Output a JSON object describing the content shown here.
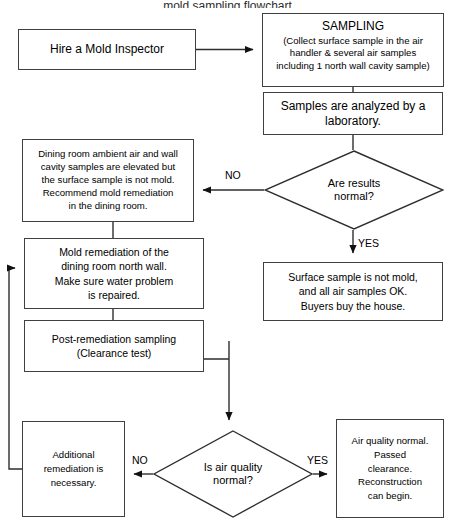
{
  "document": {
    "title_fragment": "mold sampling flowchart",
    "type": "process-flowchart",
    "background_color": "#ffffff",
    "line_color": "#404040",
    "text_color": "#000000"
  },
  "nodes": {
    "hire_inspector": {
      "id": "hire-inspector",
      "shape": "rectangle",
      "text": "Hire a Mold Inspector",
      "x": 18,
      "y": 29,
      "w": 178,
      "h": 41
    },
    "sampling": {
      "id": "sampling",
      "shape": "rectangle",
      "heading": "SAMPLING",
      "text": "(Collect surface sample in the air\nhandler & several air samples\nincluding 1 north wall cavity sample)",
      "x": 262,
      "y": 13,
      "w": 182,
      "h": 74
    },
    "lab_analysis": {
      "id": "lab-analysis",
      "shape": "rectangle",
      "text": "Samples are analyzed by a\nlaboratory.",
      "x": 263,
      "y": 92,
      "w": 180,
      "h": 43
    },
    "results_normal": {
      "id": "are-results-normal",
      "shape": "diamond",
      "text": "Are results\nnormal?",
      "x": 264,
      "y": 150,
      "w": 180,
      "h": 80
    },
    "dining_room_finding": {
      "id": "dining-room-finding",
      "shape": "rectangle",
      "text": "Dining room ambient air and wall\ncavity samples are elevated but\nthe surface sample is not mold.\nRecommend mold remediation\nin the dining room.",
      "x": 22,
      "y": 139,
      "w": 172,
      "h": 83
    },
    "surface_ok": {
      "id": "surface-sample-ok",
      "shape": "rectangle",
      "text": "Surface sample is not mold,\nand all air samples OK.\nBuyers buy the house.",
      "x": 263,
      "y": 262,
      "w": 180,
      "h": 59
    },
    "mold_remediation": {
      "id": "mold-remediation",
      "shape": "rectangle",
      "text": "Mold remediation of the\ndining room north wall.\nMake sure water problem\nis repaired.",
      "x": 24,
      "y": 238,
      "w": 180,
      "h": 71
    },
    "post_remediation": {
      "id": "post-remediation-sampling",
      "shape": "rectangle",
      "text": "Post-remediation sampling\n(Clearance test)",
      "x": 24,
      "y": 320,
      "w": 180,
      "h": 52
    },
    "air_quality_normal": {
      "id": "is-air-quality-normal",
      "shape": "diamond",
      "text": "Is air quality\nnormal?",
      "x": 153,
      "y": 430,
      "w": 160,
      "h": 88
    },
    "additional_remediation": {
      "id": "additional-remediation",
      "shape": "rectangle",
      "text": "Additional\nremediation is\nnecessary.",
      "x": 22,
      "y": 421,
      "w": 103,
      "h": 96
    },
    "clearance_passed": {
      "id": "clearance-passed",
      "shape": "rectangle",
      "text": "Air quality normal.\nPassed\nclearance.\nReconstruction\ncan begin.",
      "x": 336,
      "y": 419,
      "w": 108,
      "h": 99
    }
  },
  "edge_labels": {
    "results_no": "NO",
    "results_yes": "YES",
    "air_no": "NO",
    "air_yes": "YES"
  },
  "edges": [
    {
      "name": "hire-to-sampling",
      "from": "hire_inspector",
      "to": "sampling",
      "arrow": true
    },
    {
      "name": "sampling-to-lab",
      "from": "sampling",
      "to": "lab_analysis",
      "arrow": false
    },
    {
      "name": "lab-to-results-decision",
      "from": "lab_analysis",
      "to": "results_normal",
      "arrow": false
    },
    {
      "name": "results-no-to-dining-finding",
      "from": "results_normal",
      "to": "dining_room_finding",
      "arrow": true,
      "label": "NO"
    },
    {
      "name": "results-yes-to-surface-ok",
      "from": "results_normal",
      "to": "surface_ok",
      "arrow": true,
      "label": "YES"
    },
    {
      "name": "dining-finding-to-mold-remediation",
      "from": "dining_room_finding",
      "to": "mold_remediation",
      "arrow": false
    },
    {
      "name": "mold-remediation-to-post-sampling",
      "from": "mold_remediation",
      "to": "post_remediation",
      "arrow": false
    },
    {
      "name": "post-sampling-to-air-decision",
      "from": "post_remediation",
      "to": "air_quality_normal",
      "arrow": true
    },
    {
      "name": "air-no-to-additional-remediation",
      "from": "air_quality_normal",
      "to": "additional_remediation",
      "arrow": true,
      "label": "NO"
    },
    {
      "name": "air-yes-to-clearance-passed",
      "from": "air_quality_normal",
      "to": "clearance_passed",
      "arrow": true,
      "label": "YES"
    },
    {
      "name": "additional-remediation-loop-back",
      "from": "additional_remediation",
      "to": "mold_remediation",
      "arrow": true
    }
  ]
}
